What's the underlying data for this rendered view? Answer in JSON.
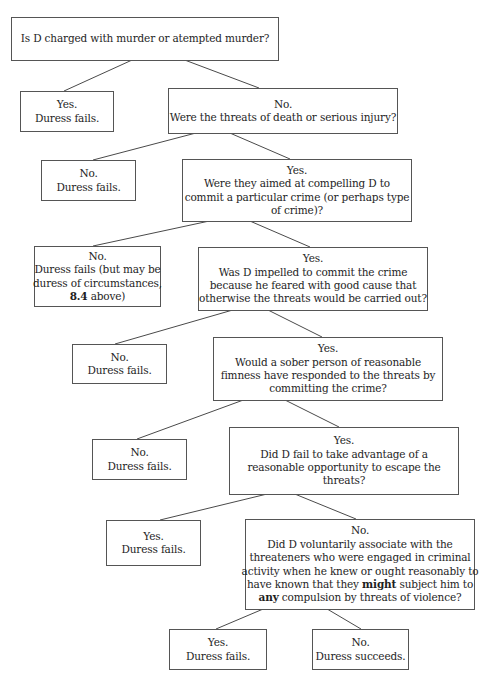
{
  "diagram": {
    "nodes": [
      {
        "id": "q1",
        "lines": [
          "Is D charged with murder or atempted murder?"
        ]
      },
      {
        "id": "q1-yes",
        "lines": [
          "Yes.",
          "Duress fails."
        ]
      },
      {
        "id": "q2",
        "lines": [
          "No.",
          "Were the threats of death or serious injury?"
        ]
      },
      {
        "id": "q2-no",
        "lines": [
          "No.",
          "Duress fails."
        ]
      },
      {
        "id": "q3",
        "lines": [
          "Yes.",
          "Were they aimed at compelling D to",
          "commit a particular crime (or perhaps type",
          "of crime)?"
        ]
      },
      {
        "id": "q3-no",
        "lines": [
          "No.",
          "Duress fails (but may be",
          "duress of circumstances,",
          "[[8.4]] above)"
        ]
      },
      {
        "id": "q4",
        "lines": [
          "Yes.",
          "Was D impelled to commit the crime",
          "because he feared with good cause that",
          "otherwise the threats would be carried out?"
        ]
      },
      {
        "id": "q4-no",
        "lines": [
          "No.",
          "Duress fails."
        ]
      },
      {
        "id": "q5",
        "lines": [
          "Yes.",
          "Would a sober person of reasonable",
          "fimness have responded to the threats by",
          "committing the crime?"
        ]
      },
      {
        "id": "q5-no",
        "lines": [
          "No.",
          "Duress fails."
        ]
      },
      {
        "id": "q6",
        "lines": [
          "Yes.",
          "Did D fail to take advantage of a",
          "reasonable opportunity to escape the",
          "threats?"
        ]
      },
      {
        "id": "q6-yes",
        "lines": [
          "Yes.",
          "Duress fails."
        ]
      },
      {
        "id": "q7",
        "lines": [
          "No.",
          "Did D voluntarily associate with the",
          "threateners who were engaged in criminal",
          "activity when he knew or ought reasonably to",
          "have known that they [[might]] subject him to",
          "[[any]] compulsion by threats of violence?"
        ]
      },
      {
        "id": "q7-yes",
        "lines": [
          "Yes.",
          "Duress fails."
        ]
      },
      {
        "id": "q7-no",
        "lines": [
          "No.",
          "Duress succeeds."
        ]
      }
    ],
    "edges": [
      {
        "from": "q1",
        "to": "q1-yes",
        "label": "Yes"
      },
      {
        "from": "q1",
        "to": "q2",
        "label": "No"
      },
      {
        "from": "q2",
        "to": "q2-no",
        "label": "No"
      },
      {
        "from": "q2",
        "to": "q3",
        "label": "Yes"
      },
      {
        "from": "q3",
        "to": "q3-no",
        "label": "No"
      },
      {
        "from": "q3",
        "to": "q4",
        "label": "Yes"
      },
      {
        "from": "q4",
        "to": "q4-no",
        "label": "No"
      },
      {
        "from": "q4",
        "to": "q5",
        "label": "Yes"
      },
      {
        "from": "q5",
        "to": "q5-no",
        "label": "No"
      },
      {
        "from": "q5",
        "to": "q6",
        "label": "Yes"
      },
      {
        "from": "q6",
        "to": "q6-yes",
        "label": "Yes"
      },
      {
        "from": "q6",
        "to": "q7",
        "label": "No"
      },
      {
        "from": "q7",
        "to": "q7-yes",
        "label": "Yes"
      },
      {
        "from": "q7",
        "to": "q7-no",
        "label": "No"
      }
    ],
    "colors": {
      "border": "#555555",
      "text": "#1e1e1e",
      "background": "#ffffff"
    }
  }
}
